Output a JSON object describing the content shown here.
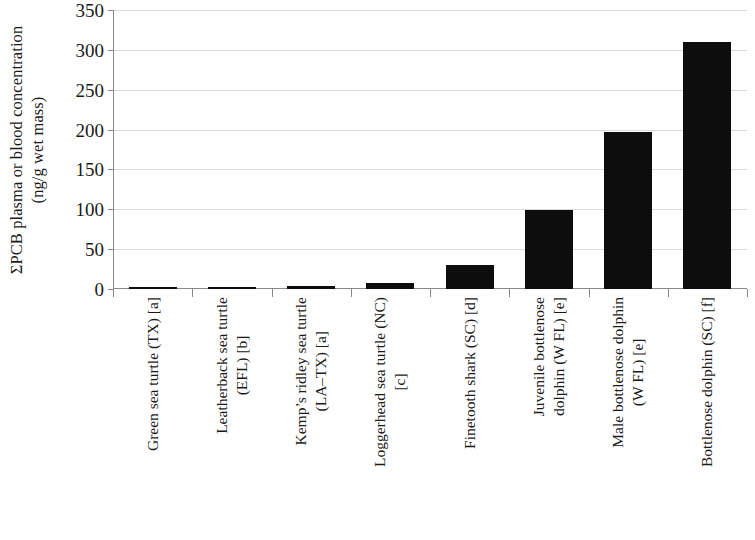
{
  "chart_data": {
    "type": "bar",
    "title": "",
    "subtitle": "",
    "xlabel": "",
    "ylabel": "ΣPCB plasma or blood concentration (ng/g wet mass)",
    "ylabel_line1": "ΣPCB plasma or blood concentration",
    "ylabel_line2": "(ng/g wet mass)",
    "ylim": [
      0,
      350
    ],
    "ytick_step": 50,
    "yticks": [
      0,
      50,
      100,
      150,
      200,
      250,
      300,
      350
    ],
    "ytick_labels": [
      "0",
      "50",
      "100",
      "150",
      "200",
      "250",
      "300",
      "350"
    ],
    "grid": true,
    "grid_axis": "y",
    "legend": "none",
    "bar_color": "#0d0d0d",
    "grid_color": "#d9d9d9",
    "axis_color": "#8a8a8a",
    "categories": [
      "Green sea turtle (TX) [a]",
      "Leatherback sea turtle (EFL) [b]",
      "Kemp’s ridley sea turtle (LA–TX) [a]",
      "Loggerhead sea turtle (NC) [c]",
      "Finetooth shark (SC) [d]",
      "Juvenile bottlenose dolphin (W FL) [e]",
      "Male bottlenose dolphin (W FL) [e]",
      "Bottlenose dolphin (SC) [f]"
    ],
    "category_lines": [
      [
        "Green sea turtle (TX) [a]"
      ],
      [
        "Leatherback sea turtle",
        "(EFL) [b]"
      ],
      [
        "Kemp’s ridley sea turtle",
        "(LA–TX) [a]"
      ],
      [
        "Loggerhead sea turtle (NC)",
        "[c]"
      ],
      [
        "Finetooth shark (SC) [d]"
      ],
      [
        "Juvenile bottlenose",
        "dolphin (W FL) [e]"
      ],
      [
        "Male bottlenose dolphin",
        "(W FL) [e]"
      ],
      [
        "Bottlenose dolphin (SC) [f]"
      ]
    ],
    "values": [
      0.5,
      3,
      4,
      8,
      30,
      99,
      197,
      310
    ]
  }
}
